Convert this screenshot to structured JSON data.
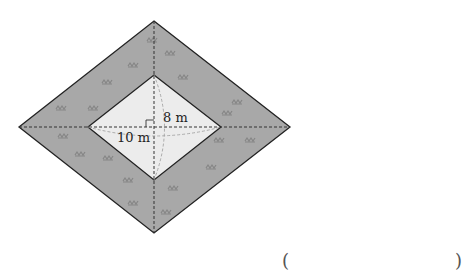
{
  "figure": {
    "outer_rhombus": {
      "top": [
        154,
        21
      ],
      "right": [
        290,
        127
      ],
      "bottom": [
        154,
        233
      ],
      "left": [
        19,
        127
      ],
      "fill": "#a8a8a8",
      "stroke": "#222222"
    },
    "inner_rhombus": {
      "top": [
        154,
        75
      ],
      "right": [
        221,
        127
      ],
      "bottom": [
        154,
        180
      ],
      "left": [
        88,
        127
      ],
      "fill": "#ececec",
      "stroke": "#222222"
    },
    "labels": {
      "vertical_diagonal": "8 m",
      "horizontal_diagonal": "10 m"
    },
    "right_angle_marker": true,
    "grass_color": "#858585"
  },
  "answer": {
    "open_paren": "(",
    "close_paren": ")",
    "value": ""
  }
}
